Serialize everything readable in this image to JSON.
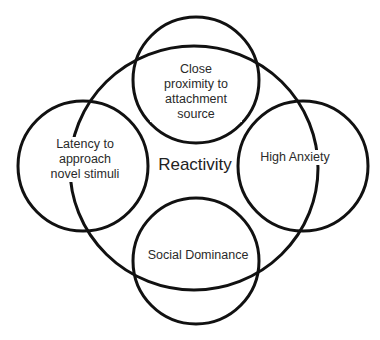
{
  "diagram": {
    "center_label": "Reactivity",
    "nodes": [
      {
        "id": "top",
        "label_lines": [
          "Close",
          "proximity to",
          "attachment",
          "source"
        ]
      },
      {
        "id": "left",
        "label_lines": [
          "Latency to",
          "approach",
          "novel stimuli"
        ]
      },
      {
        "id": "right",
        "label_lines": [
          "High Anxiety"
        ]
      },
      {
        "id": "bottom",
        "label_lines": [
          "Social Dominance"
        ]
      }
    ],
    "stroke_color": "#111111",
    "background_color": "#ffffff"
  }
}
